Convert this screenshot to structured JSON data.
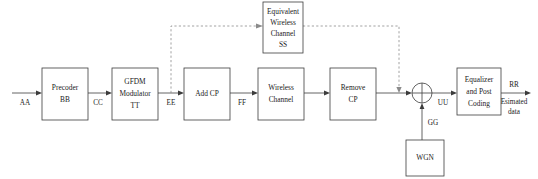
{
  "diagram": {
    "canvas": {
      "width": 538,
      "height": 179
    },
    "colors": {
      "background": "#ffffff",
      "stroke": "#3c3c3c",
      "dashed_stroke": "#8a8a8a",
      "text": "#1b1b1b"
    },
    "blocks": [
      {
        "id": "precoder",
        "lines": [
          "Precoder",
          "BB"
        ],
        "line1": "Precoder",
        "line2": "BB",
        "x": 42,
        "y": 68,
        "w": 46,
        "h": 52
      },
      {
        "id": "gfdm-modulator",
        "lines": [
          "GFDM",
          "Modulator",
          "TT"
        ],
        "line1": "GFDM",
        "line2": "Modulator",
        "line3": "TT",
        "x": 112,
        "y": 68,
        "w": 46,
        "h": 52
      },
      {
        "id": "add-cp",
        "lines": [
          "Add CP"
        ],
        "line1": "Add CP",
        "x": 184,
        "y": 68,
        "w": 46,
        "h": 52
      },
      {
        "id": "wireless-channel",
        "lines": [
          "Wireless",
          "Channel"
        ],
        "line1": "Wireless",
        "line2": "Channel",
        "x": 258,
        "y": 68,
        "w": 46,
        "h": 52
      },
      {
        "id": "remove-cp",
        "lines": [
          "Remove",
          "CP"
        ],
        "line1": "Remove",
        "line2": "CP",
        "x": 330,
        "y": 68,
        "w": 46,
        "h": 52
      },
      {
        "id": "equalizer",
        "lines": [
          "Equalizer",
          "and Post",
          "Coding"
        ],
        "line1": "Equalizer",
        "line2": "and Post",
        "line3": "Coding",
        "x": 457,
        "y": 68,
        "w": 44,
        "h": 47
      },
      {
        "id": "equivalent-wireless-channel",
        "lines": [
          "Equivalent",
          "Wireless",
          "Channel",
          "SS"
        ],
        "line1": "Equivalent",
        "line2": "Wireless",
        "line3": "Channel",
        "line4": "SS",
        "x": 263,
        "y": 2,
        "w": 40,
        "h": 51
      },
      {
        "id": "wgn",
        "lines": [
          "WGN"
        ],
        "line1": "WGN",
        "x": 406,
        "y": 140,
        "w": 38,
        "h": 36
      }
    ],
    "signal_labels": {
      "input": "AA",
      "precoder_out": "CC",
      "modulator_out": "EE",
      "addcp_out": "FF",
      "sum_out": "UU",
      "noise": "GG",
      "equalizer_out": "RR"
    },
    "output_caption": {
      "line1": "Esimated",
      "line2": "data"
    },
    "summing_node": {
      "id": "adder",
      "cx": 422,
      "cy": 93,
      "r": 10,
      "operation": "sum"
    }
  }
}
